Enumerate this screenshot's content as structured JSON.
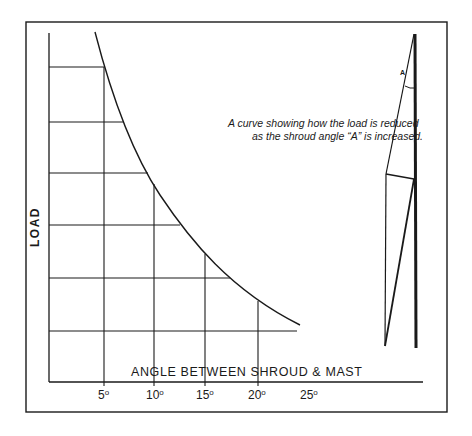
{
  "figure": {
    "annotation_line1": "A curve showing how the load is reduced",
    "annotation_line2": "as the shroud angle “A” is increased.",
    "y_axis_label": "LOAD",
    "x_axis_label": "ANGLE BETWEEN SHROUD & MAST",
    "ticks": [
      {
        "value": "5",
        "unit": "o"
      },
      {
        "value": "10",
        "unit": "o"
      },
      {
        "value": "15",
        "unit": "o"
      },
      {
        "value": "20",
        "unit": "o"
      },
      {
        "value": "25",
        "unit": "o"
      }
    ],
    "mast_diagram_angle_label": "A"
  },
  "colors": {
    "line": "#1a1a1a",
    "background": "#ffffff"
  }
}
